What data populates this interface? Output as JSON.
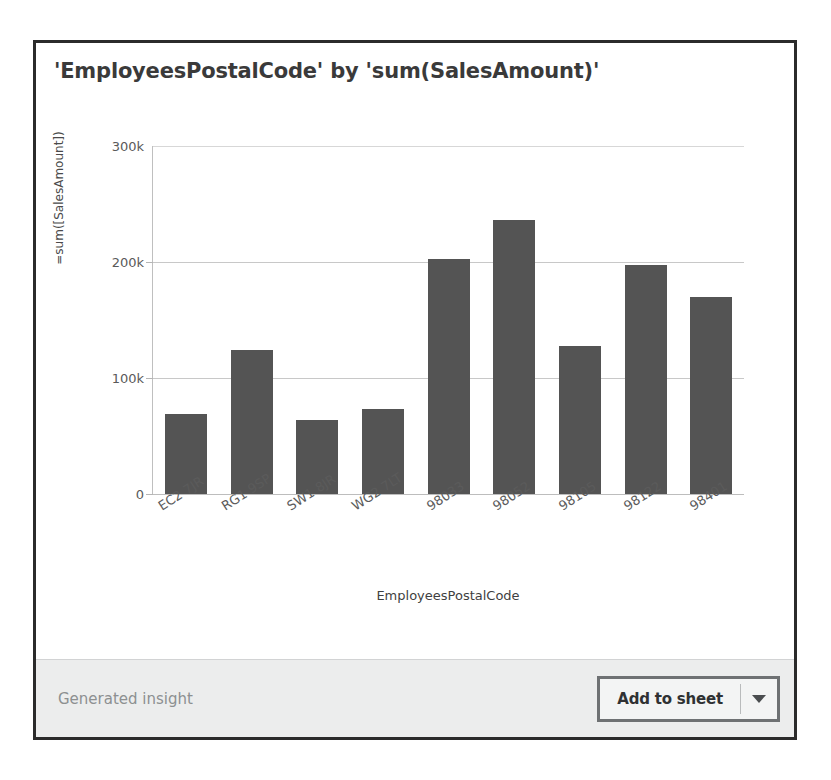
{
  "card": {
    "title": "'EmployeesPostalCode' by 'sum(SalesAmount)'",
    "footer_note": "Generated insight",
    "add_to_sheet_label": "Add to sheet",
    "dropdown_icon": "chevron-down-icon",
    "accent_border_color": "#2b2b2b",
    "bar_color": "#545454",
    "footer_bg_color": "#eceded"
  },
  "chart_data": {
    "type": "bar",
    "title": "'EmployeesPostalCode' by 'sum(SalesAmount)'",
    "xlabel": "EmployeesPostalCode",
    "ylabel": "=sum([SalesAmount])",
    "categories": [
      "EC2 7JR",
      "RG1 9SP",
      "SW1 8JR",
      "WG2 7LT",
      "98033",
      "98052",
      "98105",
      "98122",
      "98401"
    ],
    "values": [
      69000,
      124000,
      64000,
      73000,
      203000,
      236000,
      128000,
      197000,
      170000
    ],
    "ylim": [
      0,
      300000
    ],
    "yticks": [
      0,
      100000,
      200000,
      300000
    ],
    "ytick_labels": [
      "0",
      "100k",
      "200k",
      "300k"
    ],
    "grid": true,
    "legend": false
  }
}
